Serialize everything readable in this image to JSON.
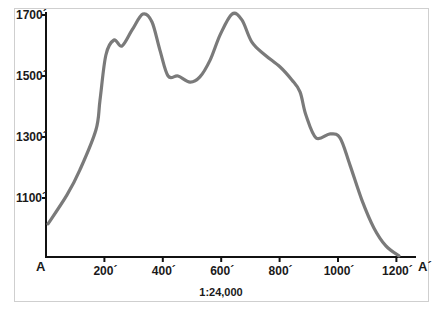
{
  "chart_data": {
    "type": "line",
    "title": "",
    "xlabel": "1:24,000",
    "ylabel": "",
    "start_label": "A",
    "end_label": "A´",
    "scale_label": "1:24,000",
    "x_ticks": [
      {
        "value": 200,
        "label": "200´"
      },
      {
        "value": 400,
        "label": "400´"
      },
      {
        "value": 600,
        "label": "600´"
      },
      {
        "value": 800,
        "label": "800´"
      },
      {
        "value": 1000,
        "label": "1000´"
      },
      {
        "value": 1200,
        "label": "1200´"
      }
    ],
    "y_ticks": [
      {
        "value": 1100,
        "label": "1100´"
      },
      {
        "value": 1300,
        "label": "1300´"
      },
      {
        "value": 1500,
        "label": "1500´"
      },
      {
        "value": 1700,
        "label": "1700´"
      }
    ],
    "xlim": [
      0,
      1250
    ],
    "ylim": [
      900,
      1720
    ],
    "grid": false,
    "legend": null,
    "series": [
      {
        "name": "Elevation profile A-A´",
        "color": "#7a7a7a",
        "x": [
          7,
          72,
          116,
          171,
          185,
          205,
          233,
          260,
          295,
          332,
          363,
          390,
          418,
          452,
          493,
          527,
          562,
          596,
          637,
          671,
          705,
          750,
          801,
          842,
          870,
          890,
          925,
          973,
          1007,
          1041,
          1082,
          1123,
          1164,
          1209
        ],
        "y": [
          1015,
          1110,
          1192,
          1323,
          1421,
          1569,
          1618,
          1598,
          1651,
          1703,
          1677,
          1585,
          1500,
          1500,
          1480,
          1497,
          1552,
          1634,
          1703,
          1684,
          1611,
          1569,
          1530,
          1487,
          1448,
          1372,
          1297,
          1310,
          1297,
          1208,
          1093,
          1002,
          943,
          910
        ]
      }
    ]
  }
}
